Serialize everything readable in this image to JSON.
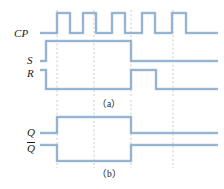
{
  "figure": {
    "type": "digital-timing-diagram",
    "width": 224,
    "height": 189,
    "background_color": "#ffffff",
    "waveform_color": "#7fa6cc",
    "waveform_shadow_color": "#b9cbe0",
    "guide_line_color": "#c9b9b0",
    "text_color": "#1a1a1a"
  },
  "labels": {
    "cp": "CP",
    "s": "S",
    "r": "R",
    "q": "Q",
    "qbar": "Q"
  },
  "captions": {
    "panel_a": "（a）",
    "panel_b": "（b）"
  },
  "chart_data": {
    "type": "timing",
    "title": "",
    "xlabel": "",
    "ylabel": "",
    "x_range": [
      40,
      218
    ],
    "guide_lines_x": [
      57,
      94,
      131,
      173
    ],
    "panels": [
      {
        "name": "a",
        "caption": "（a）",
        "signals": [
          {
            "name": "CP",
            "label": "CP",
            "low_y": 33,
            "high_y": 13,
            "start_level": 0,
            "transitions": [
              {
                "x": 57,
                "level": 1
              },
              {
                "x": 70,
                "level": 0
              },
              {
                "x": 83,
                "level": 1
              },
              {
                "x": 96,
                "level": 0
              },
              {
                "x": 112,
                "level": 1
              },
              {
                "x": 125,
                "level": 0
              },
              {
                "x": 142,
                "level": 1
              },
              {
                "x": 155,
                "level": 0
              },
              {
                "x": 172,
                "level": 1
              },
              {
                "x": 186,
                "level": 0
              }
            ]
          },
          {
            "name": "S",
            "label": "S",
            "low_y": 61,
            "high_y": 41,
            "start_level": 0,
            "transitions": [
              {
                "x": 46,
                "level": 1
              },
              {
                "x": 131,
                "level": 0
              }
            ]
          },
          {
            "name": "R",
            "label": "R",
            "low_y": 89,
            "high_y": 70,
            "start_level": 1,
            "transitions": [
              {
                "x": 46,
                "level": 0
              },
              {
                "x": 131,
                "level": 1
              },
              {
                "x": 156,
                "level": 0
              }
            ]
          }
        ]
      },
      {
        "name": "b",
        "caption": "（b）",
        "signals": [
          {
            "name": "Q",
            "label": "Q",
            "low_y": 133,
            "high_y": 117,
            "start_level": 0,
            "transitions": [
              {
                "x": 57,
                "level": 1
              },
              {
                "x": 131,
                "level": 0
              }
            ]
          },
          {
            "name": "Qbar",
            "label": "Q",
            "overline": true,
            "low_y": 161,
            "high_y": 145,
            "start_level": 1,
            "transitions": [
              {
                "x": 57,
                "level": 0
              },
              {
                "x": 131,
                "level": 1
              }
            ]
          }
        ]
      }
    ]
  }
}
